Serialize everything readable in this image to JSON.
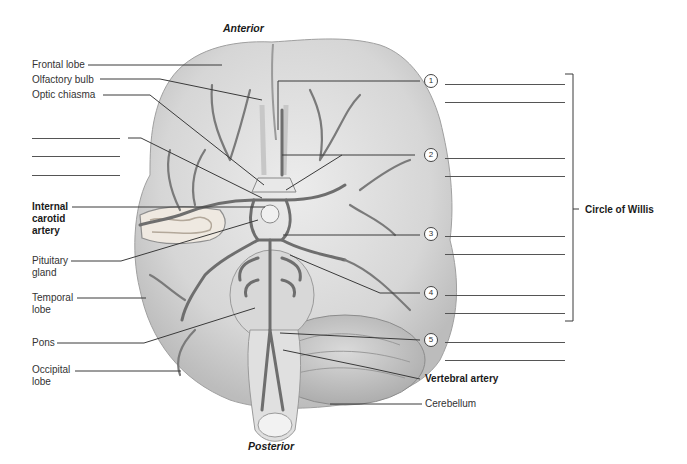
{
  "orientation": {
    "top": "Anterior",
    "bottom": "Posterior"
  },
  "left_labels": {
    "frontal_lobe": "Frontal lobe",
    "olfactory_bulb": "Olfactory bulb",
    "optic_chiasma": "Optic chiasma",
    "internal_carotid_artery": [
      "Internal",
      "carotid",
      "artery"
    ],
    "pituitary_gland": [
      "Pituitary",
      "gland"
    ],
    "temporal_lobe": [
      "Temporal",
      "lobe"
    ],
    "pons": "Pons",
    "occipital_lobe": [
      "Occipital",
      "lobe"
    ]
  },
  "right_labels": {
    "numbers": [
      "1",
      "2",
      "3",
      "4",
      "5"
    ],
    "circle_of_willis": "Circle of Willis",
    "vertebral_artery": "Vertebral artery",
    "cerebellum": "Cerebellum"
  },
  "colors": {
    "line": "#3a3a3a",
    "brain_fill": "#dcdcdc",
    "brain_shade": "#bdbdbd",
    "vessel": "#6e6e6e"
  }
}
